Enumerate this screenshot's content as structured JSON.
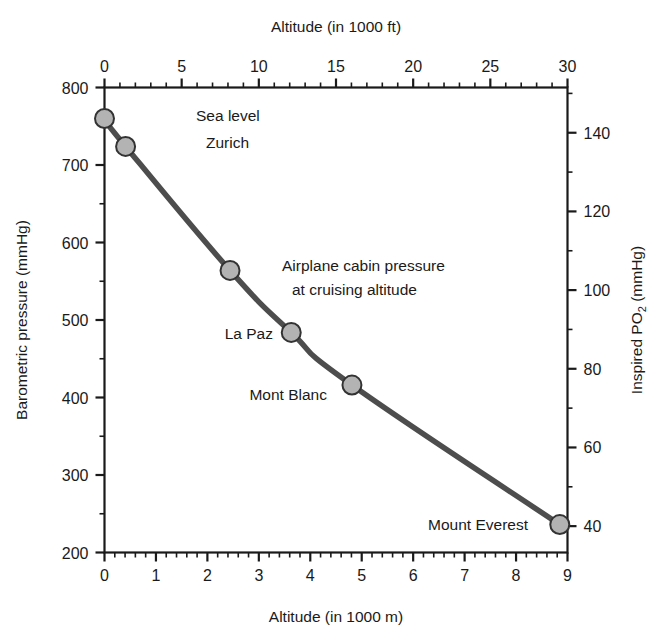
{
  "chart_data": {
    "type": "line",
    "title": "",
    "xlabel": "Altitude (in 1000 m)",
    "xlabel_top": "Altitude (in 1000 ft)",
    "ylabel": "Barometric pressure (mmHg)",
    "ylabel_right_part1": "Inspired PO",
    "ylabel_right_sub": "2",
    "ylabel_right_part2": " (mmHg)",
    "xlim": [
      0,
      9
    ],
    "xlim_top": [
      0,
      30
    ],
    "ylim": [
      200,
      800
    ],
    "ylim_right": [
      33.3,
      151.5
    ],
    "grid": false,
    "legend": "none",
    "x_ticks": [
      "0",
      "1",
      "2",
      "3",
      "4",
      "5",
      "6",
      "7",
      "8",
      "9"
    ],
    "x_tick_values": [
      0,
      1,
      2,
      3,
      4,
      5,
      6,
      7,
      8,
      9
    ],
    "x_top_ticks": [
      "0",
      "5",
      "10",
      "15",
      "20",
      "25",
      "30"
    ],
    "x_top_tick_values": [
      0,
      5,
      10,
      15,
      20,
      25,
      30
    ],
    "y_ticks": [
      "200",
      "300",
      "400",
      "500",
      "600",
      "700",
      "800"
    ],
    "y_tick_values": [
      200,
      300,
      400,
      500,
      600,
      700,
      800
    ],
    "y_right_ticks": [
      "40",
      "60",
      "80",
      "100",
      "120",
      "140"
    ],
    "y_right_tick_values": [
      40,
      60,
      80,
      100,
      120,
      140
    ],
    "series": [
      {
        "name": "Barometric pressure vs altitude",
        "line_color": "#4d4d4d",
        "marker_fill": "#b3b3b3",
        "marker_stroke": "#333333",
        "points": [
          {
            "label": "Sea level",
            "altitude_km": 0.0,
            "pressure_mmHg": 760
          },
          {
            "label": "Zurich",
            "altitude_km": 0.41,
            "pressure_mmHg": 724
          },
          {
            "label": "Airplane cabin pressure at cruising altitude",
            "altitude_km": 2.44,
            "pressure_mmHg": 564
          },
          {
            "label": "La Paz",
            "altitude_km": 3.63,
            "pressure_mmHg": 484
          },
          {
            "label": "Mont Blanc",
            "altitude_km": 4.81,
            "pressure_mmHg": 416
          },
          {
            "label": "Mount Everest",
            "altitude_km": 8.85,
            "pressure_mmHg": 236
          }
        ]
      }
    ],
    "annotations": [
      {
        "name": "sea-level-label",
        "text": "Sea level",
        "x": 196,
        "y": 121,
        "anchor": "start"
      },
      {
        "name": "zurich-label",
        "text": "Zurich",
        "x": 206,
        "y": 148,
        "anchor": "start"
      },
      {
        "name": "airplane-label-line1",
        "text": "Airplane cabin pressure",
        "x": 282,
        "y": 271,
        "anchor": "start"
      },
      {
        "name": "airplane-label-line2",
        "text": "at cruising altitude",
        "x": 292,
        "y": 295,
        "anchor": "start"
      },
      {
        "name": "lapaz-label",
        "text": "La Paz",
        "x": 273,
        "y": 339,
        "anchor": "end"
      },
      {
        "name": "montblanc-label",
        "text": "Mont Blanc",
        "x": 327,
        "y": 400,
        "anchor": "end"
      },
      {
        "name": "everest-label",
        "text": "Mount Everest",
        "x": 528,
        "y": 530,
        "anchor": "end"
      }
    ]
  }
}
